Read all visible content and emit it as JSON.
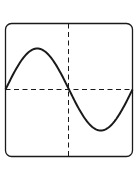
{
  "diagram": {
    "type": "sine-wave-plot",
    "curve": {
      "function": "sin",
      "periods": 1,
      "phase": "starts at zero, rising"
    },
    "colors": {
      "stroke": "#1a1a1a",
      "background": "#ffffff"
    }
  }
}
